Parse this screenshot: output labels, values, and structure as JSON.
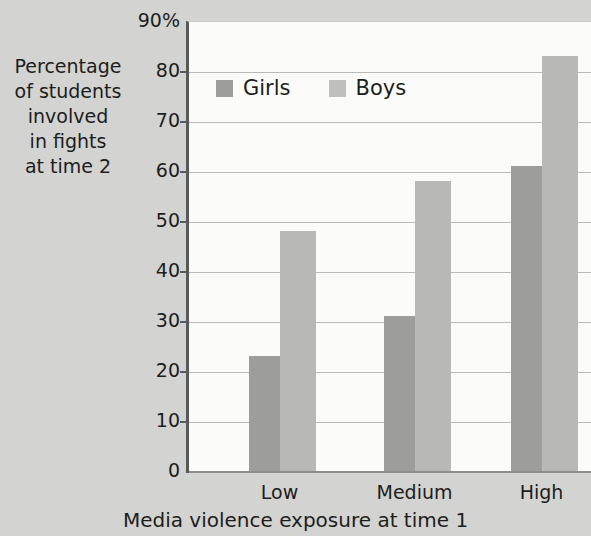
{
  "chart_data": {
    "type": "bar",
    "title": "",
    "categories": [
      "Low",
      "Medium",
      "High"
    ],
    "series": [
      {
        "name": "Girls",
        "values": [
          23,
          31,
          61
        ],
        "color": "#9d9d9b"
      },
      {
        "name": "Boys",
        "values": [
          48,
          58,
          83
        ],
        "color": "#b8b8b6"
      }
    ],
    "xlabel": "Media violence exposure at time 1",
    "ylabel": "Percentage of students involved in fights at time 2",
    "ylabel_lines": [
      "Percentage",
      "of students",
      "involved",
      "in fights",
      "at time 2"
    ],
    "ylim": [
      0,
      90
    ],
    "ytick_values": [
      0,
      10,
      20,
      30,
      40,
      50,
      60,
      70,
      80,
      90
    ],
    "ytick_labels": [
      "0",
      "10",
      "20",
      "30",
      "40",
      "50",
      "60",
      "70",
      "80",
      "90%"
    ],
    "grid": "horizontal",
    "legend_position": "top-left-inside",
    "legend_entries": [
      "Girls",
      "Boys"
    ],
    "background_color": "#d3d3d2",
    "plot_background_color": "#fbfbfa",
    "axis_color": "#58595b",
    "grid_color": "#b9b9b7"
  }
}
